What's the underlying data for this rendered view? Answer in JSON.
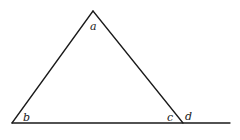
{
  "diagram": {
    "type": "triangle-with-exterior-angle",
    "stroke_color": "#1a1a1a",
    "background": "#ffffff",
    "vertices": {
      "apex": [
        93,
        11
      ],
      "bottom_left": [
        12,
        123
      ],
      "bottom_right": [
        183,
        123
      ],
      "baseline_end": [
        230,
        123
      ]
    },
    "labels": [
      {
        "id": "a",
        "text": "a",
        "x": 90,
        "y": 30
      },
      {
        "id": "b",
        "text": "b",
        "x": 23,
        "y": 121
      },
      {
        "id": "c",
        "text": "c",
        "x": 167,
        "y": 121
      },
      {
        "id": "d",
        "text": "d",
        "x": 185,
        "y": 120
      }
    ]
  }
}
